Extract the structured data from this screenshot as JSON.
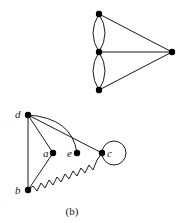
{
  "figure": {
    "caption": "(b)",
    "top_graph": {
      "nodes": [
        {
          "id": "t1",
          "x": 99,
          "y": 14
        },
        {
          "id": "t2",
          "x": 99,
          "y": 52
        },
        {
          "id": "t3",
          "x": 99,
          "y": 90
        },
        {
          "id": "t4",
          "x": 172,
          "y": 52
        }
      ],
      "edges": [
        {
          "from": "t1",
          "to": "t2",
          "type": "double-arc"
        },
        {
          "from": "t2",
          "to": "t3",
          "type": "double-arc"
        },
        {
          "from": "t1",
          "to": "t4",
          "type": "straight"
        },
        {
          "from": "t2",
          "to": "t4",
          "type": "straight"
        },
        {
          "from": "t3",
          "to": "t4",
          "type": "straight"
        }
      ]
    },
    "bottom_graph": {
      "nodes": [
        {
          "id": "d",
          "label": "d",
          "x": 28,
          "y": 115
        },
        {
          "id": "a",
          "label": "a",
          "x": 53,
          "y": 153
        },
        {
          "id": "e",
          "label": "e",
          "x": 77,
          "y": 153
        },
        {
          "id": "c",
          "label": "c",
          "x": 102,
          "y": 153
        },
        {
          "id": "b",
          "label": "b",
          "x": 28,
          "y": 190
        }
      ],
      "edges": [
        {
          "from": "d",
          "to": "b",
          "type": "straight"
        },
        {
          "from": "d",
          "to": "a",
          "type": "straight"
        },
        {
          "from": "a",
          "to": "b",
          "type": "straight"
        },
        {
          "from": "d",
          "to": "e",
          "type": "arc"
        },
        {
          "from": "d",
          "to": "c",
          "type": "straight"
        },
        {
          "from": "b",
          "to": "c",
          "type": "wavy"
        },
        {
          "from": "c",
          "to": "c",
          "type": "loop"
        }
      ]
    }
  }
}
